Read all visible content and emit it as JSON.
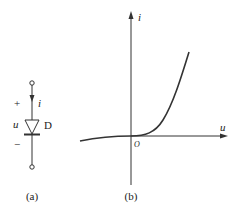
{
  "figure_a": {
    "caption": "(a)",
    "current_label": "i",
    "voltage_label": "u",
    "plus_sign": "+",
    "minus_sign": "−",
    "diode_label": "D"
  },
  "figure_b": {
    "caption": "(b)",
    "y_axis_label": "i",
    "x_axis_label": "u",
    "origin_label": "O",
    "curve": "diode i-u characteristic (exponential forward, small reverse current)"
  },
  "colors": {
    "line": "#333333",
    "background": "#ffffff"
  }
}
